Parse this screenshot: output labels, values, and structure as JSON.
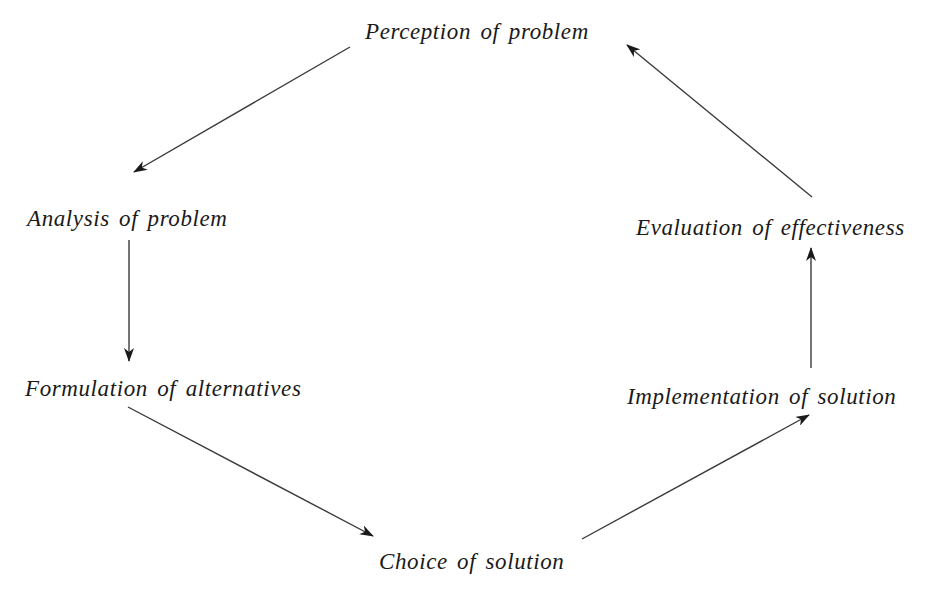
{
  "diagram": {
    "type": "cycle",
    "title": "",
    "nodes": [
      {
        "id": "perception",
        "label": "Perception of problem"
      },
      {
        "id": "analysis",
        "label": "Analysis of problem"
      },
      {
        "id": "formulation",
        "label": "Formulation of alternatives"
      },
      {
        "id": "choice",
        "label": "Choice of solution"
      },
      {
        "id": "implementation",
        "label": "Implementation of solution"
      },
      {
        "id": "evaluation",
        "label": "Evaluation of effectiveness"
      }
    ],
    "edges": [
      {
        "from": "perception",
        "to": "analysis"
      },
      {
        "from": "analysis",
        "to": "formulation"
      },
      {
        "from": "formulation",
        "to": "choice"
      },
      {
        "from": "choice",
        "to": "implementation"
      },
      {
        "from": "implementation",
        "to": "evaluation"
      },
      {
        "from": "evaluation",
        "to": "perception"
      }
    ],
    "colors": {
      "text": "#1a1a1a",
      "arrow": "#3a3a3a",
      "background": "#ffffff"
    }
  }
}
